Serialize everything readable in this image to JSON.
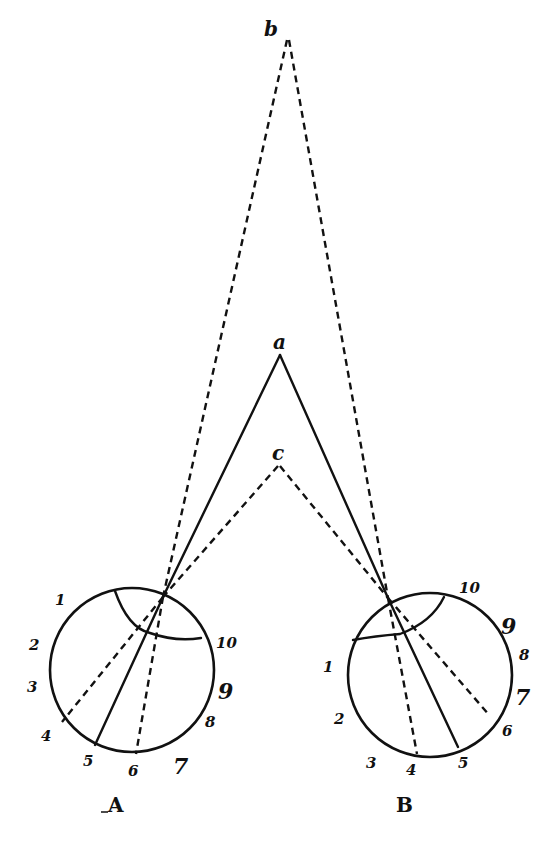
{
  "diagram": {
    "points": {
      "b": {
        "label": "b",
        "x": 287,
        "y": 40
      },
      "a": {
        "label": "a",
        "x": 280,
        "y": 355
      },
      "c": {
        "label": "c",
        "x": 278,
        "y": 460
      }
    },
    "eyes": [
      {
        "id": "A",
        "label": "A",
        "center": [
          132,
          670
        ],
        "radius": 82,
        "nodal_point": [
          163,
          597
        ],
        "numbers": [
          "1",
          "2",
          "3",
          "4",
          "5",
          "6",
          "7",
          "8",
          "9",
          "10"
        ],
        "rays": [
          {
            "to": "b",
            "style": "dashed",
            "retina_mark": "6"
          },
          {
            "to": "a",
            "style": "solid",
            "retina_mark": "5"
          },
          {
            "to": "c",
            "style": "dashed",
            "retina_mark": "4"
          }
        ]
      },
      {
        "id": "B",
        "label": "B",
        "center": [
          430,
          675
        ],
        "radius": 82,
        "nodal_point": [
          388,
          598
        ],
        "numbers": [
          "1",
          "2",
          "3",
          "4",
          "5",
          "6",
          "7",
          "8",
          "9",
          "10"
        ],
        "rays": [
          {
            "to": "b",
            "style": "dashed",
            "retina_mark": "4"
          },
          {
            "to": "a",
            "style": "solid",
            "retina_mark": "5"
          },
          {
            "to": "c",
            "style": "dashed",
            "retina_mark": "6"
          }
        ]
      }
    ],
    "colors": {
      "ink": "#111111",
      "paper": "#ffffff"
    }
  }
}
